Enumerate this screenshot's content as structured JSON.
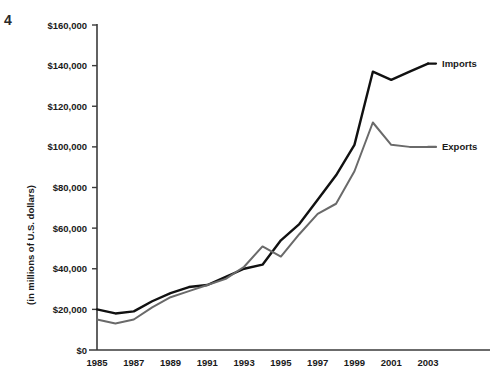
{
  "page": {
    "corner_mark": "4"
  },
  "chart_data": {
    "type": "line",
    "title": "",
    "xlabel": "",
    "ylabel": "(in millions of U.S. dollars)",
    "x": [
      1985,
      1986,
      1987,
      1988,
      1989,
      1990,
      1991,
      1992,
      1993,
      1994,
      1995,
      1996,
      1997,
      1998,
      1999,
      2000,
      2001,
      2002,
      2003
    ],
    "xlim": [
      1985,
      2003
    ],
    "ylim": [
      0,
      160000
    ],
    "grid": false,
    "legend_position": "right",
    "x_tick_labels": [
      "1985",
      "1987",
      "1989",
      "1991",
      "1993",
      "1995",
      "1997",
      "1999",
      "2001",
      "2003"
    ],
    "x_ticks": [
      1985,
      1987,
      1989,
      1991,
      1993,
      1995,
      1997,
      1999,
      2001,
      2003
    ],
    "y_ticks": [
      0,
      20000,
      40000,
      60000,
      80000,
      100000,
      120000,
      140000,
      160000
    ],
    "y_tick_labels": [
      "$0",
      "$20,000",
      "$40,000",
      "$60,000",
      "$80,000",
      "$100,000",
      "$120,000",
      "$140,000",
      "$160,000"
    ],
    "series": [
      {
        "name": "Imports",
        "color": "#111111",
        "values": [
          20000,
          18000,
          19000,
          24000,
          28000,
          31000,
          32000,
          36000,
          40000,
          42000,
          54000,
          62000,
          74000,
          86000,
          101000,
          137000,
          133000,
          137000,
          141000
        ]
      },
      {
        "name": "Exports",
        "color": "#6a6a6a",
        "values": [
          15000,
          13000,
          15000,
          21000,
          26000,
          29000,
          32000,
          35000,
          41000,
          51000,
          46000,
          57000,
          67000,
          72000,
          88000,
          112000,
          101000,
          100000,
          100000
        ]
      }
    ],
    "legend": [
      {
        "label": "Imports",
        "color": "#111111"
      },
      {
        "label": "Exports",
        "color": "#6a6a6a"
      }
    ],
    "axis_color": "#3a3a3a"
  }
}
